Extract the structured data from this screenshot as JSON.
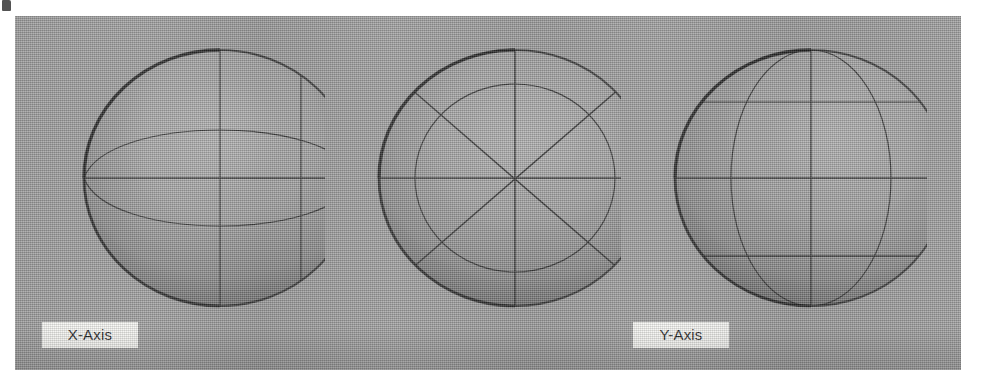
{
  "figure": {
    "kind": "three-sphere-axis-diagram",
    "panel_background_color": "#9d9d9d",
    "page_background_color": "#ffffff",
    "label_box_color": "#f7f7f4",
    "wireframe_color": "#2a2a2a",
    "spheres": [
      {
        "id": "sphere-x",
        "label": "X-Axis",
        "view": "side",
        "center_x": 205,
        "center_y": 163,
        "radius": 135,
        "wireframe": {
          "latitude_arcs": 2,
          "meridian_lines": 2,
          "equator_line": true
        }
      },
      {
        "id": "sphere-y",
        "label": "Y-Axis",
        "view": "polar",
        "center_x": 500,
        "center_y": 163,
        "radius": 135,
        "wireframe": {
          "inner_circle": true,
          "radial_spokes": 8,
          "equator_line": true
        }
      },
      {
        "id": "sphere-z",
        "label": "Z-Axis",
        "view": "front",
        "center_x": 796,
        "center_y": 163,
        "radius": 135,
        "wireframe": {
          "meridian_ellipse": true,
          "meridian_lines": 1,
          "latitude_lines": 3,
          "equator_line": true
        }
      }
    ]
  },
  "labels": {
    "x_axis": "X-Axis",
    "y_axis": "Y-Axis",
    "z_axis": "Z-Axis"
  }
}
